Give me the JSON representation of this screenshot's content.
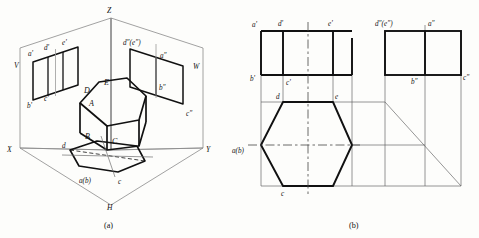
{
  "figure": {
    "title_a": "(a)",
    "title_b": "(b)"
  },
  "colors": {
    "line_thick": "#111111",
    "line_thin": "#4a4a4a",
    "plane_edge": "#777777",
    "text": "#111111",
    "background": "#fdfdfb"
  },
  "panel_a": {
    "name": "pictorial-projection-box",
    "axes": [
      {
        "key": "z",
        "label": "Z"
      },
      {
        "key": "x",
        "label": "X"
      },
      {
        "key": "y",
        "label": "Y"
      }
    ],
    "planes": [
      {
        "key": "v",
        "label": "V"
      },
      {
        "key": "w",
        "label": "W"
      },
      {
        "key": "h",
        "label": "H"
      }
    ],
    "v_plane_labels": [
      {
        "key": "a-prime",
        "label": "a'"
      },
      {
        "key": "d-prime",
        "label": "d'"
      },
      {
        "key": "e-prime",
        "label": "e'"
      },
      {
        "key": "b-prime",
        "label": "b'"
      },
      {
        "key": "c-prime",
        "label": "c'"
      }
    ],
    "w_plane_labels": [
      {
        "key": "de-double-prime",
        "label": "d″(e″)"
      },
      {
        "key": "a-double-prime",
        "label": "a″"
      },
      {
        "key": "b-double-prime",
        "label": "b″"
      },
      {
        "key": "c-double-prime",
        "label": "c″"
      }
    ],
    "solid_labels": [
      {
        "key": "A",
        "label": "A"
      },
      {
        "key": "B",
        "label": "B"
      },
      {
        "key": "C",
        "label": "C"
      },
      {
        "key": "D",
        "label": "D"
      },
      {
        "key": "E",
        "label": "E"
      }
    ],
    "h_plane_labels": [
      {
        "key": "d",
        "label": "d"
      },
      {
        "key": "ab",
        "label": "a(b)"
      },
      {
        "key": "c",
        "label": "c"
      }
    ]
  },
  "panel_b": {
    "name": "three-view-orthographic",
    "front_view": {
      "name": "front-view",
      "labels": [
        {
          "key": "a-prime",
          "label": "a'"
        },
        {
          "key": "d-prime",
          "label": "d'"
        },
        {
          "key": "e-prime",
          "label": "e'"
        },
        {
          "key": "b-prime",
          "label": "b'"
        },
        {
          "key": "c-prime",
          "label": "c'"
        }
      ]
    },
    "side_view": {
      "name": "side-view",
      "labels": [
        {
          "key": "de-double-prime",
          "label": "d″(e″)"
        },
        {
          "key": "a-double-prime",
          "label": "a″"
        },
        {
          "key": "b-double-prime",
          "label": "b″"
        },
        {
          "key": "c-double-prime",
          "label": "c″"
        }
      ]
    },
    "top_view": {
      "name": "top-view",
      "labels": [
        {
          "key": "d",
          "label": "d"
        },
        {
          "key": "e",
          "label": "e"
        },
        {
          "key": "ab",
          "label": "a(b)"
        },
        {
          "key": "c",
          "label": "c"
        }
      ]
    }
  }
}
